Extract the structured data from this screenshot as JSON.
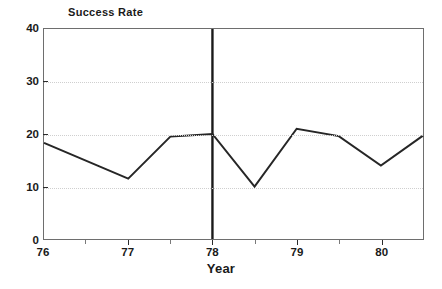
{
  "chart_data": {
    "type": "line",
    "title": "",
    "xlabel": "Year",
    "ylabel": "Success Rate",
    "xlim": [
      76,
      80.5
    ],
    "ylim": [
      0,
      40
    ],
    "grid": true,
    "legend": "none",
    "x_ticks": [
      76,
      77,
      78,
      79,
      80
    ],
    "x_tick_labels": [
      "76",
      "77",
      "78",
      "79",
      "80"
    ],
    "x_minor_ticks": [
      76.5,
      77.5,
      78.5,
      79.5,
      80.5
    ],
    "y_ticks": [
      0,
      10,
      20,
      30,
      40
    ],
    "y_tick_labels": [
      "0",
      "10",
      "20",
      "30",
      "40"
    ],
    "series": [
      {
        "name": "Success Rate",
        "color": "#262626",
        "x": [
          76,
          77,
          77.5,
          78,
          78.5,
          79,
          79.5,
          80,
          80.5
        ],
        "values": [
          18.3,
          11.5,
          19.5,
          20.0,
          10.0,
          21.0,
          19.6,
          14.0,
          19.7
        ]
      }
    ],
    "annotations": [
      {
        "name": "intervention-line",
        "type": "vertical-line",
        "x": 78,
        "y_from": 0,
        "y_to": 40,
        "color": "#1a1a1a"
      }
    ]
  },
  "axes": {
    "y_title": "Success Rate",
    "x_title": "Year"
  }
}
